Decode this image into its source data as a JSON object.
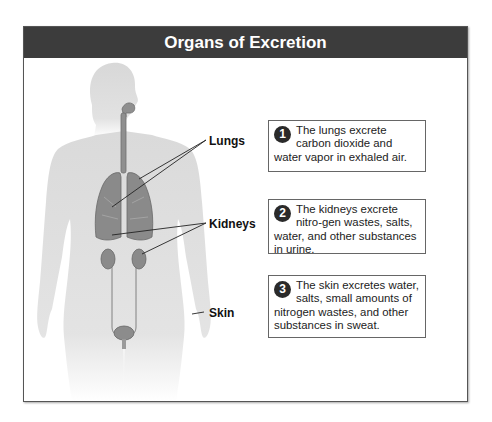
{
  "title": "Organs of Excretion",
  "labels": {
    "lungs": "Lungs",
    "kidneys": "Kidneys",
    "skin": "Skin"
  },
  "callouts": [
    {
      "number": "1",
      "text": "The lungs excrete carbon dioxide and water vapor in exhaled air."
    },
    {
      "number": "2",
      "text": "The kidneys excrete nitro-gen wastes, salts, water, and other substances in urine."
    },
    {
      "number": "3",
      "text": "The skin excretes water, salts, small amounts of nitrogen wastes, and other substances in sweat."
    }
  ],
  "colors": {
    "header_bg": "#3c3c3c",
    "body_silhouette": "#dcdcdc",
    "organ": "#8a8a8a"
  }
}
